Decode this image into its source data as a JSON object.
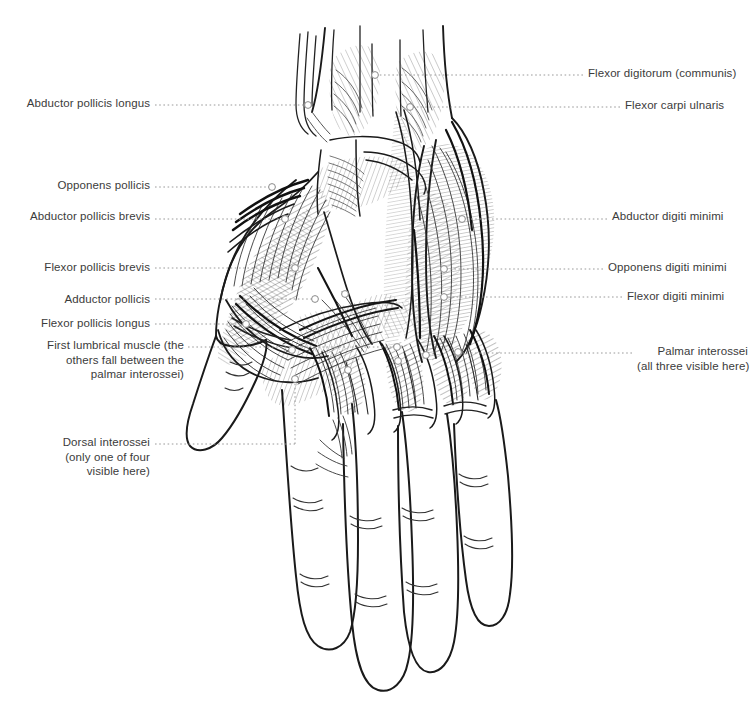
{
  "figure": {
    "type": "anatomical-line-drawing",
    "background_color": "#ffffff",
    "ink_color": "#1a1a1a",
    "label_color": "#3b3b3b",
    "leader_color": "#9a9a9a",
    "marker_fill": "#ffffff",
    "marker_stroke": "#8a8a8a"
  },
  "labels": {
    "left": [
      {
        "id": "abductor-pollicis-longus",
        "lines": [
          "Abductor pollicis longus"
        ],
        "x": 150,
        "y": 96,
        "leader": {
          "from_x": 155,
          "to_x": 308,
          "y": 105
        },
        "marker": {
          "x": 308,
          "y": 105
        }
      },
      {
        "id": "opponens-pollicis",
        "lines": [
          "Opponens pollicis"
        ],
        "x": 150,
        "y": 178,
        "leader": {
          "from_x": 155,
          "to_x": 272,
          "y": 187
        },
        "marker": {
          "x": 272,
          "y": 187
        }
      },
      {
        "id": "abductor-pollicis-brevis",
        "lines": [
          "Abductor pollicis brevis"
        ],
        "x": 150,
        "y": 209,
        "leader": {
          "from_x": 155,
          "to_x": 285,
          "y": 219
        },
        "marker": {
          "x": 285,
          "y": 219
        }
      },
      {
        "id": "flexor-pollicis-brevis",
        "lines": [
          "Flexor pollicis brevis"
        ],
        "x": 150,
        "y": 260,
        "leader": {
          "from_x": 155,
          "to_x": 295,
          "y": 268
        },
        "marker": {
          "x": 295,
          "y": 268
        }
      },
      {
        "id": "adductor-pollicis",
        "lines": [
          "Adductor pollicis"
        ],
        "x": 150,
        "y": 292,
        "leader": {
          "from_x": 155,
          "to_x": 315,
          "y": 299
        },
        "marker": {
          "x": 315,
          "y": 299
        }
      },
      {
        "id": "flexor-pollicis-longus",
        "lines": [
          "Flexor pollicis longus"
        ],
        "x": 150,
        "y": 316,
        "leader": {
          "from_x": 155,
          "to_x": 246,
          "y": 324
        },
        "marker": {
          "x": 246,
          "y": 324
        }
      },
      {
        "id": "first-lumbrical-muscle",
        "lines": [
          "First lumbrical muscle (the",
          "others fall between the",
          "palmar interossei)"
        ],
        "x": 184,
        "y": 338,
        "leader": {
          "from_x": 188,
          "to_x": 397,
          "y": 347
        },
        "marker": {
          "x": 397,
          "y": 347
        }
      },
      {
        "id": "dorsal-interossei",
        "lines": [
          "Dorsal interossei",
          "(only one of four",
          "visible here)"
        ],
        "x": 150,
        "y": 435,
        "leader": {
          "from_x": 155,
          "to_x": 295,
          "y": 444
        },
        "elbow": {
          "x": 295,
          "from_y": 444,
          "to_y": 379
        },
        "marker": {
          "x": 295,
          "y": 379
        }
      }
    ],
    "right": [
      {
        "id": "flexor-digitorum-communis",
        "lines": [
          "Flexor digitorum (communis)"
        ],
        "x": 588,
        "y": 66,
        "leader": {
          "from_x": 583,
          "to_x": 375,
          "y": 75
        },
        "marker": {
          "x": 375,
          "y": 75
        }
      },
      {
        "id": "flexor-carpi-ulnaris",
        "lines": [
          "Flexor carpi ulnaris"
        ],
        "x": 625,
        "y": 98,
        "leader": {
          "from_x": 620,
          "to_x": 410,
          "y": 107
        },
        "marker": {
          "x": 410,
          "y": 107
        }
      },
      {
        "id": "abductor-digiti-minimi",
        "lines": [
          "Abductor digiti minimi"
        ],
        "x": 612,
        "y": 209,
        "leader": {
          "from_x": 607,
          "to_x": 462,
          "y": 219
        },
        "marker": {
          "x": 462,
          "y": 219
        }
      },
      {
        "id": "opponens-digiti-minimi",
        "lines": [
          "Opponens digiti minimi"
        ],
        "x": 608,
        "y": 260,
        "leader": {
          "from_x": 603,
          "to_x": 444,
          "y": 269
        },
        "marker": {
          "x": 444,
          "y": 269
        }
      },
      {
        "id": "flexor-digiti-minimi",
        "lines": [
          "Flexor digiti minimi"
        ],
        "x": 627,
        "y": 289,
        "leader": {
          "from_x": 622,
          "to_x": 444,
          "y": 297
        },
        "marker": {
          "x": 444,
          "y": 297
        }
      },
      {
        "id": "palmar-interossei",
        "lines": [
          "Palmar interossei",
          "(all three visible here)"
        ],
        "x": 637,
        "y": 344,
        "leader": {
          "from_x": 632,
          "to_x": 458,
          "y": 353
        },
        "marker": {
          "x": 458,
          "y": 353
        }
      }
    ]
  },
  "extra_markers": [
    {
      "id": "marker-palm-a",
      "x": 345,
      "y": 294
    },
    {
      "id": "marker-palm-b",
      "x": 348,
      "y": 370
    },
    {
      "id": "marker-web-a",
      "x": 398,
      "y": 361
    },
    {
      "id": "marker-web-b",
      "x": 426,
      "y": 355
    },
    {
      "id": "marker-web-c",
      "x": 458,
      "y": 352
    },
    {
      "id": "marker-thenar-low",
      "x": 292,
      "y": 350
    }
  ]
}
